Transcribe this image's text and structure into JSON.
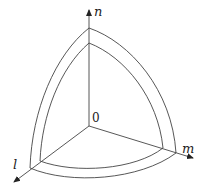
{
  "diagram": {
    "type": "3d-axes-spherical-shell-octant",
    "labels": {
      "n_axis": "n",
      "m_axis": "m",
      "l_axis": "l",
      "origin": "0"
    },
    "colors": {
      "stroke": "#333333",
      "background": "#ffffff"
    }
  }
}
